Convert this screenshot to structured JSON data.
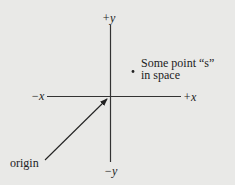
{
  "diagram": {
    "type": "cartesian-axes",
    "axes": {
      "pos_y_label": "+y",
      "neg_y_label": "−y",
      "pos_x_label": "+x",
      "neg_x_label": "−x"
    },
    "point": {
      "label_line1": "Some point “s”",
      "label_line2": "in space"
    },
    "origin": {
      "label": "origin"
    },
    "colors": {
      "background": "#e9e9e7",
      "ink": "#222222"
    }
  }
}
